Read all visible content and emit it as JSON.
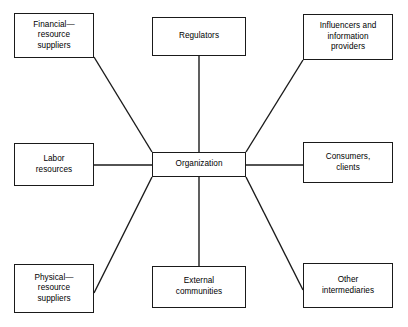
{
  "diagram": {
    "type": "hub-and-spoke",
    "canvas": {
      "width": 408,
      "height": 327,
      "background": "#ffffff"
    },
    "stroke_color": "#1a1a1a",
    "text_color": "#000000",
    "center": {
      "id": "organization",
      "label": "Organization",
      "lines": [
        "Organization"
      ]
    },
    "nodes": [
      {
        "id": "financial-resource-suppliers",
        "label": "Financial— resource suppliers",
        "lines": [
          "Financial—",
          "resource",
          "suppliers"
        ],
        "position": "top-left"
      },
      {
        "id": "regulators",
        "label": "Regulators",
        "lines": [
          "Regulators"
        ],
        "position": "top-center"
      },
      {
        "id": "influencers-and-information-providers",
        "label": "Influencers and information providers",
        "lines": [
          "Influencers and",
          "information",
          "providers"
        ],
        "position": "top-right"
      },
      {
        "id": "labor-resources",
        "label": "Labor resources",
        "lines": [
          "Labor",
          "resources"
        ],
        "position": "middle-left"
      },
      {
        "id": "consumers-clients",
        "label": "Consumers, clients",
        "lines": [
          "Consumers,",
          "clients"
        ],
        "position": "middle-right"
      },
      {
        "id": "physical-resource-suppliers",
        "label": "Physical— resource suppliers",
        "lines": [
          "Physical—",
          "resource",
          "suppliers"
        ],
        "position": "bottom-left"
      },
      {
        "id": "external-communities",
        "label": "External communities",
        "lines": [
          "External",
          "communities"
        ],
        "position": "bottom-center"
      },
      {
        "id": "other-intermediaries",
        "label": "Other intermediaries",
        "lines": [
          "Other",
          "intermediaries"
        ],
        "position": "bottom-right"
      }
    ],
    "connectors": [
      {
        "id": "connector-financial",
        "from": "organization",
        "to": "financial-resource-suppliers",
        "x1": 152,
        "y1": 152,
        "x2": 94,
        "y2": 57
      },
      {
        "id": "connector-regulators",
        "from": "organization",
        "to": "regulators",
        "x1": 199,
        "y1": 152,
        "x2": 199,
        "y2": 56
      },
      {
        "id": "connector-influencers",
        "from": "organization",
        "to": "influencers-and-information-providers",
        "x1": 246,
        "y1": 152,
        "x2": 303,
        "y2": 60
      },
      {
        "id": "connector-labor",
        "from": "organization",
        "to": "labor-resources",
        "x1": 152,
        "y1": 165,
        "x2": 94,
        "y2": 165
      },
      {
        "id": "connector-consumers",
        "from": "organization",
        "to": "consumers-clients",
        "x1": 246,
        "y1": 165,
        "x2": 303,
        "y2": 165
      },
      {
        "id": "connector-physical",
        "from": "organization",
        "to": "physical-resource-suppliers",
        "x1": 152,
        "y1": 177,
        "x2": 94,
        "y2": 293
      },
      {
        "id": "connector-external",
        "from": "organization",
        "to": "external-communities",
        "x1": 199,
        "y1": 177,
        "x2": 199,
        "y2": 266
      },
      {
        "id": "connector-intermediaries",
        "from": "organization",
        "to": "other-intermediaries",
        "x1": 246,
        "y1": 177,
        "x2": 303,
        "y2": 290
      }
    ]
  }
}
